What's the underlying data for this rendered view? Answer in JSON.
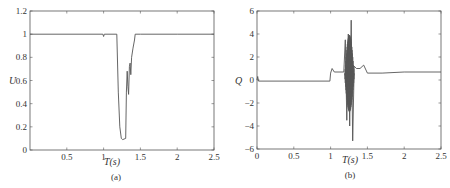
{
  "chart_data": [
    {
      "type": "line",
      "panel_label": "(a)",
      "title": "",
      "xlabel": "T(s)",
      "ylabel": "U",
      "xlim": [
        0,
        2.5
      ],
      "ylim": [
        0,
        1.2
      ],
      "xticks": [
        "0.5",
        "1",
        "1.5",
        "2",
        "2.5"
      ],
      "yticks": [
        "0",
        "0.2",
        "0.4",
        "0.6",
        "0.8",
        "1",
        "1.2"
      ],
      "grid": false,
      "series": [
        {
          "name": "U",
          "x": [
            0,
            0.99,
            1.0,
            1.01,
            1.18,
            1.2,
            1.22,
            1.24,
            1.26,
            1.3,
            1.31,
            1.32,
            1.33,
            1.34,
            1.35,
            1.36,
            1.37,
            1.38,
            1.4,
            1.42,
            1.43,
            1.5,
            2.0,
            2.5
          ],
          "values": [
            1.0,
            1.0,
            0.98,
            1.0,
            1.0,
            0.5,
            0.2,
            0.1,
            0.09,
            0.1,
            0.5,
            0.68,
            0.55,
            0.48,
            0.72,
            0.75,
            0.65,
            0.8,
            0.88,
            0.95,
            1.0,
            1.0,
            1.0,
            1.0
          ]
        }
      ]
    },
    {
      "type": "line",
      "panel_label": "(b)",
      "title": "",
      "xlabel": "T(s)",
      "ylabel": "Q",
      "xlim": [
        0,
        2.5
      ],
      "ylim": [
        -6,
        6
      ],
      "xticks": [
        "0",
        "0.5",
        "1",
        "1.5",
        "2",
        "2.5"
      ],
      "yticks": [
        "-6",
        "-4",
        "-2",
        "0",
        "2",
        "4",
        "6"
      ],
      "grid": false,
      "series": [
        {
          "name": "Q",
          "x": [
            0,
            0.01,
            0.02,
            0.99,
            1.0,
            1.02,
            1.05,
            1.18,
            1.2,
            1.22,
            1.24,
            1.26,
            1.28,
            1.3,
            1.32,
            1.35,
            1.4,
            1.45,
            1.5,
            1.7,
            2.0,
            2.5
          ],
          "values": [
            0.0,
            0.3,
            -0.1,
            -0.1,
            0.6,
            1.0,
            0.7,
            0.7,
            3.5,
            -3.5,
            4.0,
            -4.0,
            5.2,
            -5.3,
            1.2,
            1.0,
            1.0,
            1.3,
            0.6,
            0.6,
            0.7,
            0.7
          ]
        }
      ]
    }
  ],
  "panels": {
    "a": {
      "caption": "(a)",
      "xlabel": "T(s)",
      "ylabel": "U",
      "xticks": [
        {
          "v": 0.5,
          "label": "0.5"
        },
        {
          "v": 1,
          "label": "1"
        },
        {
          "v": 1.5,
          "label": "1.5"
        },
        {
          "v": 2,
          "label": "2"
        },
        {
          "v": 2.5,
          "label": "2.5"
        }
      ],
      "yticks": [
        {
          "v": 0,
          "label": "0"
        },
        {
          "v": 0.2,
          "label": "0.2"
        },
        {
          "v": 0.4,
          "label": "0.4"
        },
        {
          "v": 0.6,
          "label": "0.6"
        },
        {
          "v": 0.8,
          "label": "0.8"
        },
        {
          "v": 1,
          "label": "1"
        },
        {
          "v": 1.2,
          "label": "1.2"
        }
      ]
    },
    "b": {
      "caption": "(b)",
      "xlabel": "T(s)",
      "ylabel": "Q",
      "xticks": [
        {
          "v": 0,
          "label": "0"
        },
        {
          "v": 0.5,
          "label": "0.5"
        },
        {
          "v": 1,
          "label": "1"
        },
        {
          "v": 1.5,
          "label": "1.5"
        },
        {
          "v": 2,
          "label": "2"
        },
        {
          "v": 2.5,
          "label": "2.5"
        }
      ],
      "yticks": [
        {
          "v": -6,
          "label": "−6"
        },
        {
          "v": -4,
          "label": "−4"
        },
        {
          "v": -2,
          "label": "−2"
        },
        {
          "v": 0,
          "label": "0"
        },
        {
          "v": 2,
          "label": "2"
        },
        {
          "v": 4,
          "label": "4"
        },
        {
          "v": 6,
          "label": "6"
        }
      ]
    }
  },
  "colors": {
    "axis": "#555555",
    "line": "#555555",
    "text": "#333333"
  }
}
